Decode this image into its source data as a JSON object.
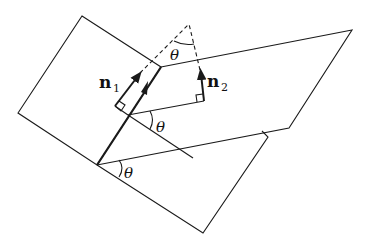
{
  "diagram": {
    "labels": {
      "n1": "n",
      "n1_sub": "1",
      "n2": "n",
      "n2_sub": "2",
      "theta_top": "θ",
      "theta_middle": "θ",
      "theta_bottom": "θ"
    },
    "colors": {
      "stroke": "#1a1a1a",
      "background": "#ffffff"
    }
  }
}
